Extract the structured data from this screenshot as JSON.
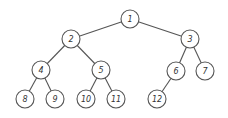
{
  "diagram": {
    "type": "binary-tree",
    "colors": {
      "stroke": "#555555",
      "text": "#333333",
      "background": "#ffffff"
    },
    "node_radius": 9,
    "nodes": [
      {
        "id": "1",
        "label": "1",
        "x": 130,
        "y": 19
      },
      {
        "id": "2",
        "label": "2",
        "x": 71,
        "y": 39
      },
      {
        "id": "3",
        "label": "3",
        "x": 190,
        "y": 39
      },
      {
        "id": "4",
        "label": "4",
        "x": 41,
        "y": 70
      },
      {
        "id": "5",
        "label": "5",
        "x": 101,
        "y": 70
      },
      {
        "id": "6",
        "label": "6",
        "x": 176,
        "y": 71
      },
      {
        "id": "7",
        "label": "7",
        "x": 205,
        "y": 71
      },
      {
        "id": "8",
        "label": "8",
        "x": 25,
        "y": 99
      },
      {
        "id": "9",
        "label": "9",
        "x": 55,
        "y": 99
      },
      {
        "id": "10",
        "label": "10",
        "x": 86,
        "y": 99
      },
      {
        "id": "11",
        "label": "11",
        "x": 116,
        "y": 99
      },
      {
        "id": "12",
        "label": "12",
        "x": 157,
        "y": 99
      }
    ],
    "edges": [
      {
        "from": "1",
        "to": "2"
      },
      {
        "from": "1",
        "to": "3"
      },
      {
        "from": "2",
        "to": "4"
      },
      {
        "from": "2",
        "to": "5"
      },
      {
        "from": "3",
        "to": "6"
      },
      {
        "from": "3",
        "to": "7"
      },
      {
        "from": "4",
        "to": "8"
      },
      {
        "from": "4",
        "to": "9"
      },
      {
        "from": "5",
        "to": "10"
      },
      {
        "from": "5",
        "to": "11"
      },
      {
        "from": "6",
        "to": "12"
      }
    ]
  }
}
